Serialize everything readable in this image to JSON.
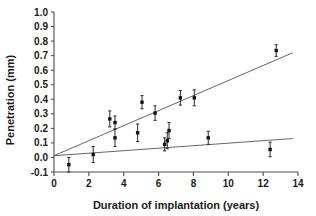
{
  "chart_data": {
    "type": "scatter",
    "title": "",
    "xlabel": "Duration of implantation (years)",
    "ylabel": "Penetration (mm)",
    "xlim": [
      0,
      14
    ],
    "ylim": [
      -0.1,
      1.0
    ],
    "xticks": [
      0,
      2,
      4,
      6,
      8,
      10,
      12,
      14
    ],
    "xtick_labels": [
      "0",
      "2",
      "4",
      "6",
      "8",
      "10",
      "12",
      "14"
    ],
    "yticks": [
      -0.1,
      0.0,
      0.1,
      0.2,
      0.3,
      0.4,
      0.5,
      0.6,
      0.7,
      0.8,
      0.9,
      1.0
    ],
    "ytick_labels": [
      "-0.1",
      "0.0",
      "0.1",
      "0.2",
      "0.3",
      "0.4",
      "0.5",
      "0.6",
      "0.7",
      "0.8",
      "0.9",
      "1.0"
    ],
    "grid": false,
    "legend": "none",
    "marker_style": "filled-square-with-vertical-error-bars",
    "points": [
      {
        "x": 0.85,
        "y": -0.05,
        "yerr": 0.05
      },
      {
        "x": 2.25,
        "y": 0.02,
        "yerr": 0.055
      },
      {
        "x": 3.2,
        "y": 0.265,
        "yerr": 0.055
      },
      {
        "x": 3.5,
        "y": 0.24,
        "yerr": 0.045
      },
      {
        "x": 3.5,
        "y": 0.135,
        "yerr": 0.06
      },
      {
        "x": 4.8,
        "y": 0.17,
        "yerr": 0.06
      },
      {
        "x": 5.05,
        "y": 0.38,
        "yerr": 0.045
      },
      {
        "x": 5.8,
        "y": 0.305,
        "yerr": 0.05
      },
      {
        "x": 6.35,
        "y": 0.09,
        "yerr": 0.045
      },
      {
        "x": 6.5,
        "y": 0.115,
        "yerr": 0.055
      },
      {
        "x": 6.6,
        "y": 0.185,
        "yerr": 0.055
      },
      {
        "x": 7.25,
        "y": 0.41,
        "yerr": 0.05
      },
      {
        "x": 8.05,
        "y": 0.41,
        "yerr": 0.055
      },
      {
        "x": 8.85,
        "y": 0.135,
        "yerr": 0.045
      },
      {
        "x": 12.4,
        "y": 0.055,
        "yerr": 0.05
      },
      {
        "x": 12.75,
        "y": 0.735,
        "yerr": 0.04
      }
    ],
    "series": [
      {
        "name": "upper-regression-line",
        "type": "line",
        "x": [
          0.0,
          13.7
        ],
        "values": [
          0.012,
          0.72
        ]
      },
      {
        "name": "lower-regression-line",
        "type": "line",
        "x": [
          0.0,
          13.7
        ],
        "values": [
          0.012,
          0.13
        ]
      }
    ],
    "colors": {
      "marker": "#111111",
      "errorbar": "#2b2b2b",
      "line": "#555555",
      "axis": "#4d4d4d",
      "background": "#ffffff"
    }
  }
}
